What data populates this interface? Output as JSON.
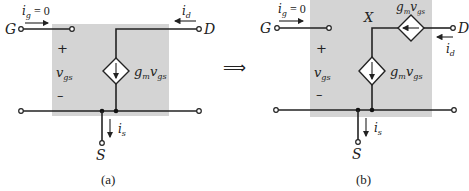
{
  "figure": {
    "connector_symbol": "⟹",
    "panel_a": {
      "caption": "(a)",
      "gate_terminal": "G",
      "drain_terminal": "D",
      "source_terminal": "S",
      "gate_current": {
        "base": "i",
        "sub": "g",
        "suffix": " = 0"
      },
      "drain_current": {
        "base": "i",
        "sub": "d"
      },
      "source_current": {
        "base": "i",
        "sub": "s"
      },
      "control_voltage": {
        "base": "v",
        "sub": "gs"
      },
      "plus_sign": "+",
      "minus_sign": "–",
      "dependent_source": {
        "base": "g",
        "sub1": "m",
        "mid": "v",
        "sub2": "gs"
      }
    },
    "panel_b": {
      "caption": "(b)",
      "gate_terminal": "G",
      "drain_terminal": "D",
      "source_terminal": "S",
      "node_label": "X",
      "gate_current": {
        "base": "i",
        "sub": "g",
        "suffix": " = 0"
      },
      "drain_current": {
        "base": "i",
        "sub": "d"
      },
      "source_current": {
        "base": "i",
        "sub": "s"
      },
      "control_voltage": {
        "base": "v",
        "sub": "gs"
      },
      "plus_sign": "+",
      "minus_sign": "–",
      "dependent_source_vertical": {
        "base": "g",
        "sub1": "m",
        "mid": "v",
        "sub2": "gs"
      },
      "dependent_source_horizontal": {
        "base": "g",
        "sub1": "m",
        "mid": "v",
        "sub2": "gs"
      }
    }
  }
}
